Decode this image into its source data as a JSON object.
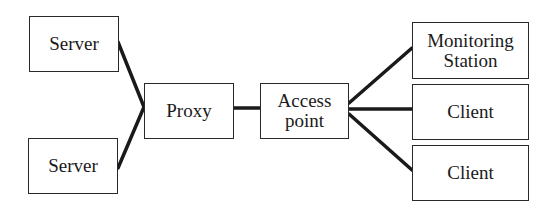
{
  "diagram": {
    "nodes": [
      {
        "id": "server-1",
        "label": "Server",
        "x": 29,
        "y": 16,
        "w": 90,
        "h": 56
      },
      {
        "id": "server-2",
        "label": "Server",
        "x": 28,
        "y": 138,
        "w": 90,
        "h": 56
      },
      {
        "id": "proxy",
        "label": "Proxy",
        "x": 144,
        "y": 83,
        "w": 90,
        "h": 56
      },
      {
        "id": "access-point",
        "label": "Access point",
        "x": 260,
        "y": 83,
        "w": 89,
        "h": 56
      },
      {
        "id": "monitoring-station",
        "label": "Monitoring Station",
        "x": 412,
        "y": 22,
        "w": 117,
        "h": 57
      },
      {
        "id": "client-1",
        "label": "Client",
        "x": 412,
        "y": 84,
        "w": 117,
        "h": 56
      },
      {
        "id": "client-2",
        "label": "Client",
        "x": 412,
        "y": 145,
        "w": 117,
        "h": 56
      }
    ],
    "edges": [
      {
        "from": "server-1",
        "to": "proxy"
      },
      {
        "from": "server-2",
        "to": "proxy"
      },
      {
        "from": "proxy",
        "to": "access-point"
      },
      {
        "from": "access-point",
        "to": "monitoring-station"
      },
      {
        "from": "access-point",
        "to": "client-1"
      },
      {
        "from": "access-point",
        "to": "client-2"
      }
    ]
  }
}
